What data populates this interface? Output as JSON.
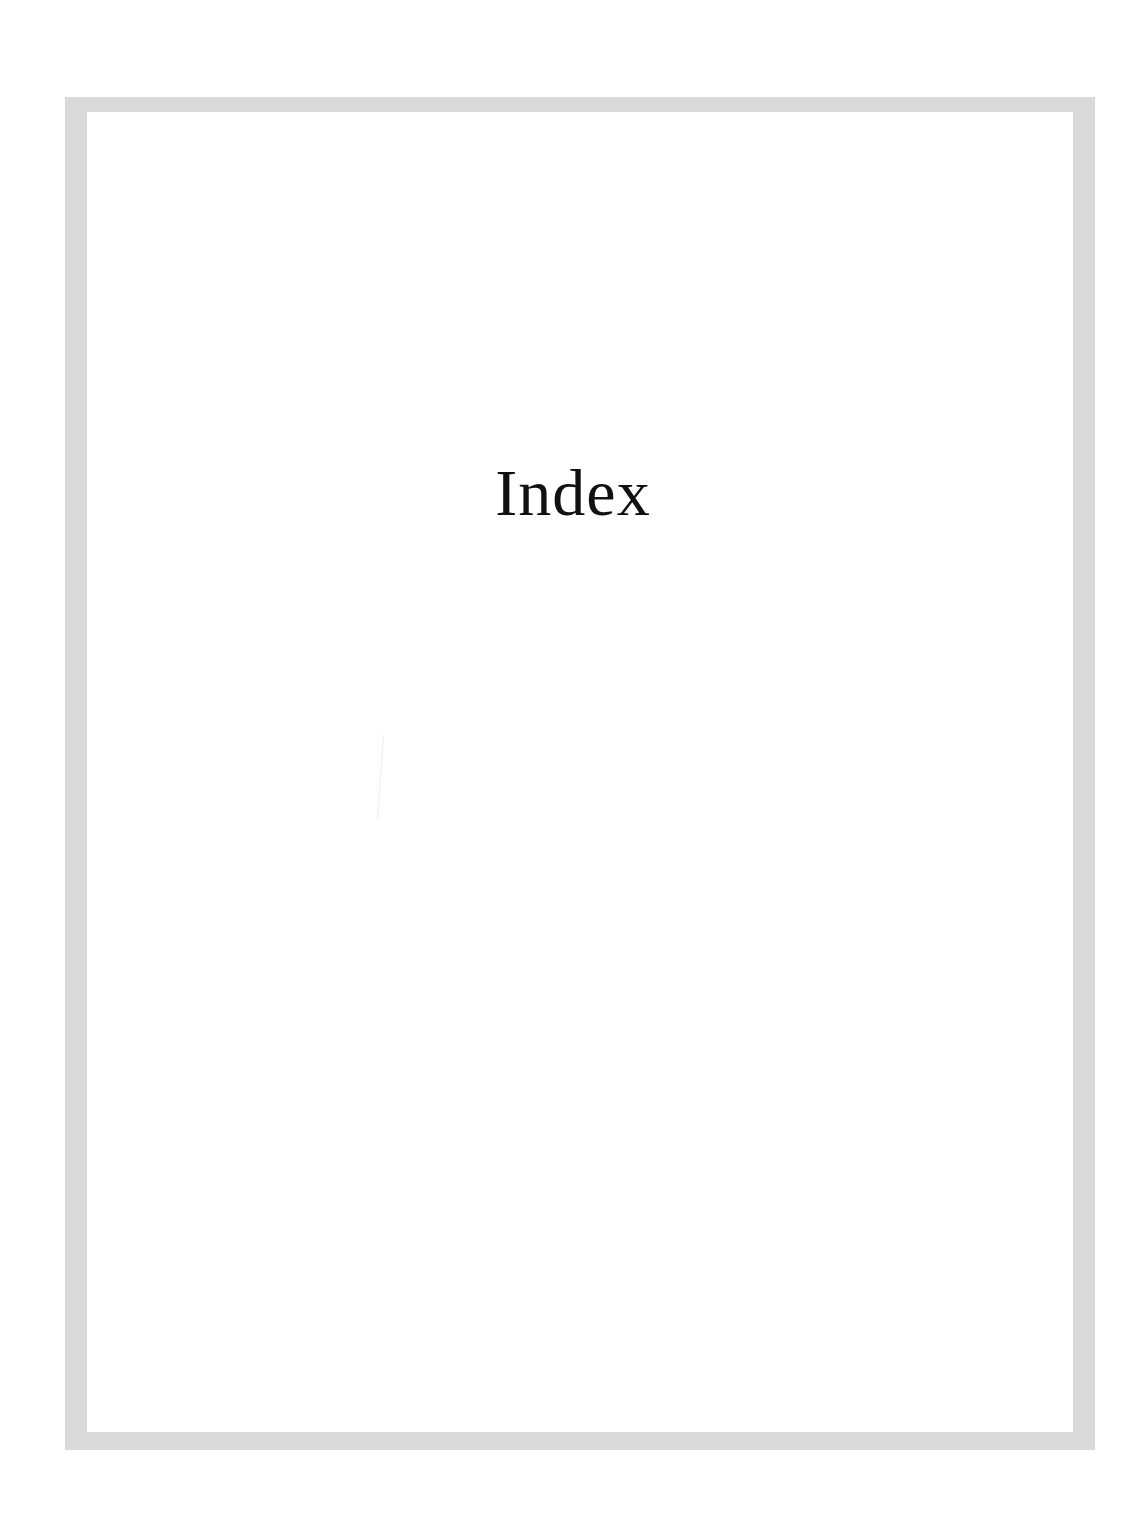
{
  "page": {
    "title": "Index"
  },
  "colors": {
    "frame": "#dadada",
    "background": "#ffffff",
    "text": "#111111"
  }
}
